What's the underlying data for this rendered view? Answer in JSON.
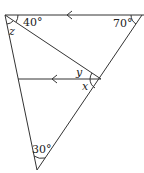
{
  "diagram": {
    "type": "geometry",
    "stroke_color": "#333333",
    "angles": {
      "top_left": "40°",
      "top_right": "70°",
      "bottom": "30°",
      "z": "z",
      "y": "y",
      "x": "x"
    },
    "parallel_markers": [
      "top-line-arrow",
      "middle-line-arrow"
    ]
  }
}
